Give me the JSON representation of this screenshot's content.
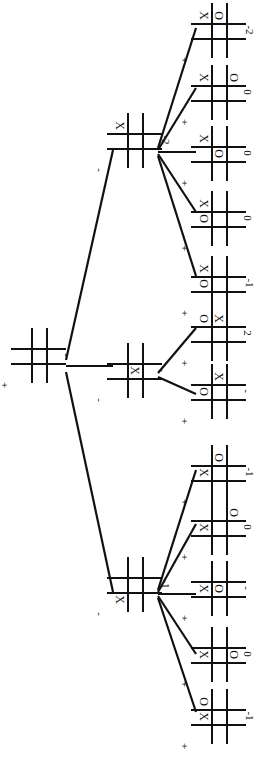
{
  "figure": {
    "kind": "minimax-game-tree",
    "game": "tic-tac-toe",
    "orientation_note": "rotated 90 degrees",
    "board_size": 3
  },
  "tree": {
    "root": {
      "id": "root",
      "board": [
        "",
        "",
        "",
        "",
        "",
        "",
        "",
        "",
        ""
      ],
      "value": "-",
      "player": "+",
      "x": 16,
      "y": 333,
      "cell": 15
    },
    "level1": [
      {
        "id": "n1",
        "board": [
          "X",
          "",
          "",
          "",
          "",
          "",
          "",
          "",
          ""
        ],
        "value": "-2",
        "player": "-",
        "x": 112,
        "y": 118,
        "cell": 15
      },
      {
        "id": "n2",
        "board": [
          "",
          "",
          "",
          "",
          "X",
          "",
          "",
          "",
          ""
        ],
        "value": "-",
        "player": "-",
        "x": 112,
        "y": 348,
        "cell": 15
      },
      {
        "id": "n3",
        "board": [
          "",
          "",
          "",
          "",
          "",
          "",
          "X",
          "",
          ""
        ],
        "value": "-1",
        "player": "-",
        "x": 112,
        "y": 562,
        "cell": 15
      }
    ],
    "level2": [
      {
        "id": "l1",
        "parent": "n1",
        "board": [
          "X",
          "O",
          "",
          "",
          "",
          "",
          "",
          "",
          ""
        ],
        "value": "-2",
        "player": "+",
        "x": 196,
        "y": 8,
        "cell": 15
      },
      {
        "id": "l2",
        "parent": "n1",
        "board": [
          "X",
          "",
          "O",
          "",
          "",
          "",
          "",
          "",
          ""
        ],
        "value": "0",
        "player": "+",
        "x": 196,
        "y": 70,
        "cell": 15
      },
      {
        "id": "l3",
        "parent": "n1",
        "board": [
          "X",
          "",
          "",
          "",
          "O",
          "",
          "",
          "",
          ""
        ],
        "value": "0",
        "player": "+",
        "x": 196,
        "y": 131,
        "cell": 15
      },
      {
        "id": "l4",
        "parent": "n1",
        "board": [
          "X",
          "",
          "",
          "O",
          "",
          "",
          "",
          "",
          ""
        ],
        "value": "0",
        "player": "+",
        "x": 196,
        "y": 196,
        "cell": 15
      },
      {
        "id": "l5",
        "parent": "n1",
        "board": [
          "X",
          "",
          "",
          "O",
          "",
          "",
          "",
          "",
          ""
        ],
        "value": "-1",
        "player": "+",
        "x": 196,
        "y": 261,
        "cell": 15
      },
      {
        "id": "l6",
        "parent": "n2",
        "board": [
          "O",
          "X",
          "",
          "",
          "",
          "",
          "",
          "",
          ""
        ],
        "value": "2",
        "player": "+",
        "x": 196,
        "y": 311,
        "cell": 15
      },
      {
        "id": "l7",
        "parent": "n2",
        "board": [
          "",
          "X",
          "",
          "O",
          "",
          "",
          "",
          "",
          ""
        ],
        "value": "-",
        "player": "+",
        "x": 196,
        "y": 369,
        "cell": 15
      },
      {
        "id": "l8",
        "parent": "n3",
        "board": [
          "",
          "O",
          "",
          "X",
          "",
          "",
          "",
          "",
          ""
        ],
        "value": "-1",
        "player": "+",
        "x": 196,
        "y": 450,
        "cell": 15
      },
      {
        "id": "l9",
        "parent": "n3",
        "board": [
          "",
          "",
          "O",
          "X",
          "",
          "",
          "",
          "",
          ""
        ],
        "value": "0",
        "player": "+",
        "x": 196,
        "y": 505,
        "cell": 15
      },
      {
        "id": "l10",
        "parent": "n3",
        "board": [
          "",
          "",
          "",
          "X",
          "O",
          "",
          "",
          "",
          ""
        ],
        "value": "-",
        "player": "+",
        "x": 196,
        "y": 566,
        "cell": 15
      },
      {
        "id": "l11",
        "parent": "n3",
        "board": [
          "",
          "",
          "",
          "X",
          "",
          "O",
          "",
          "",
          ""
        ],
        "value": "0",
        "player": "+",
        "x": 196,
        "y": 632,
        "cell": 15
      },
      {
        "id": "l12",
        "parent": "n3",
        "board": [
          "O",
          "",
          "",
          "X",
          "",
          "",
          "",
          "",
          ""
        ],
        "value": "-1",
        "player": "+",
        "x": 196,
        "y": 694,
        "cell": 15
      }
    ],
    "edges": [
      {
        "from": "root",
        "to": "n1",
        "x1": 66,
        "y1": 360,
        "x2": 113,
        "y2": 150
      },
      {
        "from": "root",
        "to": "n2",
        "x1": 66,
        "y1": 366,
        "x2": 113,
        "y2": 366
      },
      {
        "from": "root",
        "to": "n3",
        "x1": 66,
        "y1": 372,
        "x2": 113,
        "y2": 592
      },
      {
        "from": "n1",
        "to": "l1",
        "x1": 158,
        "y1": 148,
        "x2": 196,
        "y2": 28
      },
      {
        "from": "n1",
        "to": "l2",
        "x1": 158,
        "y1": 150,
        "x2": 196,
        "y2": 88
      },
      {
        "from": "n1",
        "to": "l3",
        "x1": 158,
        "y1": 152,
        "x2": 196,
        "y2": 152
      },
      {
        "from": "n1",
        "to": "l4",
        "x1": 158,
        "y1": 154,
        "x2": 196,
        "y2": 212
      },
      {
        "from": "n1",
        "to": "l5",
        "x1": 158,
        "y1": 156,
        "x2": 196,
        "y2": 276
      },
      {
        "from": "n2",
        "to": "l6",
        "x1": 158,
        "y1": 373,
        "x2": 196,
        "y2": 328
      },
      {
        "from": "n2",
        "to": "l7",
        "x1": 158,
        "y1": 377,
        "x2": 196,
        "y2": 394
      },
      {
        "from": "n3",
        "to": "l8",
        "x1": 158,
        "y1": 590,
        "x2": 196,
        "y2": 470
      },
      {
        "from": "n3",
        "to": "l9",
        "x1": 158,
        "y1": 592,
        "x2": 196,
        "y2": 524
      },
      {
        "from": "n3",
        "to": "l10",
        "x1": 158,
        "y1": 594,
        "x2": 196,
        "y2": 594
      },
      {
        "from": "n3",
        "to": "l11",
        "x1": 158,
        "y1": 596,
        "x2": 196,
        "y2": 654
      },
      {
        "from": "n3",
        "to": "l12",
        "x1": 158,
        "y1": 598,
        "x2": 196,
        "y2": 712
      }
    ]
  },
  "colors": {
    "ink": "#111111",
    "background": "#ffffff"
  }
}
